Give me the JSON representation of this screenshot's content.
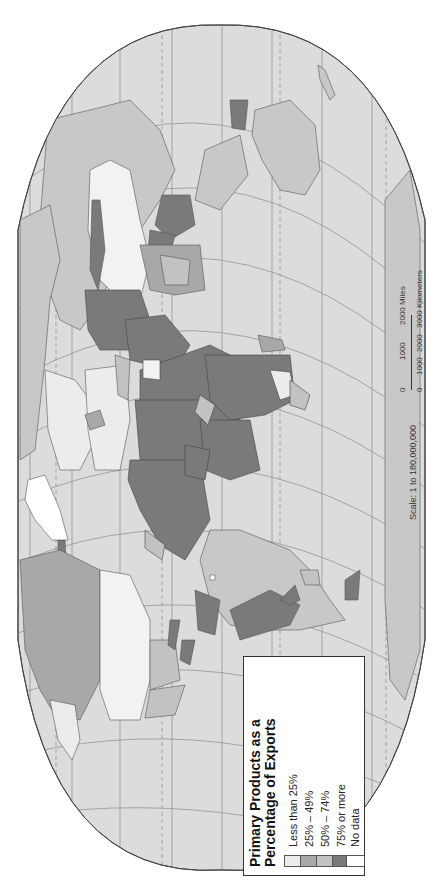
{
  "map": {
    "projection_orientation": "rotated-90-ccw",
    "ocean_color": "#dcdcdc",
    "grid_color": "#8a8a8a"
  },
  "legend": {
    "title_line1": "Primary Products as a",
    "title_line2": "Percentage of Exports",
    "items": [
      {
        "label": "Less than 25%",
        "color": "#ececec"
      },
      {
        "label": "25% – 49%",
        "color": "#a8a8a8"
      },
      {
        "label": "50% – 74%",
        "color": "#c2c2c2"
      },
      {
        "label": "75% or more",
        "color": "#7a7a7a"
      },
      {
        "label": "No data",
        "color": "#ffffff"
      }
    ]
  },
  "scale": {
    "ratio_label": "Scale:  1 to 180,000,000",
    "miles_ticks": [
      "0",
      "1000",
      "2000 Miles"
    ],
    "km_ticks": [
      "0",
      "1000",
      "2000",
      "3000 Kilometers"
    ]
  }
}
